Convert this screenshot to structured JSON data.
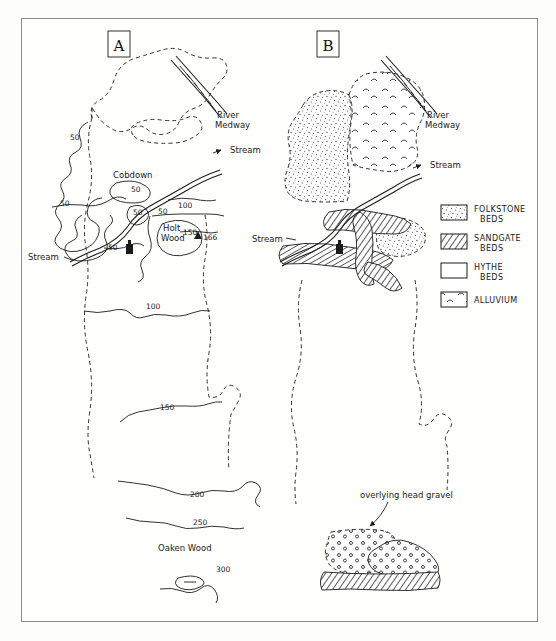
{
  "figure": {
    "type": "geological-sketch-map-pair",
    "background_color": "#fdfdfc",
    "ink_color": "#1b1b1b",
    "frame_color": "#8d8d8d"
  },
  "panels": [
    {
      "id": "A",
      "label": "A",
      "kind": "topographic-contour-map",
      "labels": {
        "river": "River\nMedway",
        "river_line1": "River",
        "river_line2": "Medway",
        "stream_right": "Stream",
        "stream_left": "Stream",
        "place_cobdown": "Cobdown",
        "place_holt_wood_line1": "Holt",
        "place_holt_wood_line2": "Wood",
        "place_oaken_wood": "Oaken Wood",
        "spot_height": "166"
      },
      "contours": [
        "50",
        "50",
        "50",
        "50",
        "50",
        "50",
        "100",
        "100",
        "150",
        "150",
        "200",
        "250",
        "300"
      ],
      "contour_values_unique": [
        "50",
        "100",
        "150",
        "200",
        "250",
        "300"
      ]
    },
    {
      "id": "B",
      "label": "B",
      "kind": "geological-map",
      "labels": {
        "river_line1": "River",
        "river_line2": "Medway",
        "stream_right": "Stream",
        "stream_left": "Stream",
        "annotation_head_gravel": "overlying head gravel"
      }
    }
  ],
  "legend": {
    "name": "geology-legend",
    "items": [
      {
        "pattern": "stipple",
        "line1": "FOLKSTONE",
        "line2": "BEDS",
        "swatch_name": "folkstone-beds-swatch"
      },
      {
        "pattern": "hatch",
        "line1": "SANDGATE",
        "line2": "BEDS",
        "swatch_name": "sandgate-beds-swatch"
      },
      {
        "pattern": "blank",
        "line1": "HYTHE",
        "line2": "BEDS",
        "swatch_name": "hythe-beds-swatch"
      },
      {
        "pattern": "waves",
        "line1": "ALLUVIUM",
        "line2": "",
        "swatch_name": "alluvium-swatch"
      }
    ]
  }
}
